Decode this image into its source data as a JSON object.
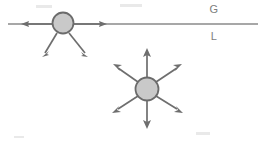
{
  "figure": {
    "width": 266,
    "height": 146,
    "background_color": "#ffffff"
  },
  "colors": {
    "line": "#8a8a8a",
    "arrow": "#6e6e6e",
    "bubble_fill": "#c9c9c9",
    "bubble_stroke": "#6b6b6b",
    "label_text": "#7d7d7d"
  },
  "labels": {
    "gas_phase": "G",
    "liquid_phase": "L",
    "gas_label_x": 214,
    "gas_label_y": 13,
    "liquid_label_x": 214,
    "liquid_label_y": 36
  },
  "interface_line": {
    "name": "gas-liquid-interface",
    "x1": 8,
    "y1": 24,
    "x2": 258,
    "y2": 24
  },
  "bubbles": [
    {
      "name": "interface-bubble",
      "cx": 63,
      "cy": 23,
      "r": 10.5,
      "arrow_count": 4
    },
    {
      "name": "bulk-bubble",
      "cx": 147,
      "cy": 89,
      "r": 11.5,
      "arrow_count": 6
    }
  ],
  "interface_bubble_arrows": [
    {
      "name": "arrow-left",
      "angle_deg": 180,
      "tip_x": 21,
      "tip_y": 24
    },
    {
      "name": "arrow-right",
      "angle_deg": 0,
      "tip_x": 107,
      "tip_y": 24
    },
    {
      "name": "arrow-down-left",
      "angle_deg": 123,
      "tip_x": 42,
      "tip_y": 57
    },
    {
      "name": "arrow-down-right",
      "angle_deg": 57,
      "tip_x": 88,
      "tip_y": 57
    }
  ],
  "bulk_bubble_arrows": [
    {
      "name": "arrow-up",
      "angle_deg": 270,
      "tip_x": 147,
      "tip_y": 48
    },
    {
      "name": "arrow-down",
      "angle_deg": 90,
      "tip_x": 147,
      "tip_y": 129
    },
    {
      "name": "arrow-up-left",
      "angle_deg": 215,
      "tip_x": 113,
      "tip_y": 64
    },
    {
      "name": "arrow-up-right",
      "angle_deg": 325,
      "tip_x": 182,
      "tip_y": 64
    },
    {
      "name": "arrow-down-left",
      "angle_deg": 145,
      "tip_x": 112,
      "tip_y": 113
    },
    {
      "name": "arrow-down-right",
      "angle_deg": 35,
      "tip_x": 183,
      "tip_y": 113
    }
  ]
}
